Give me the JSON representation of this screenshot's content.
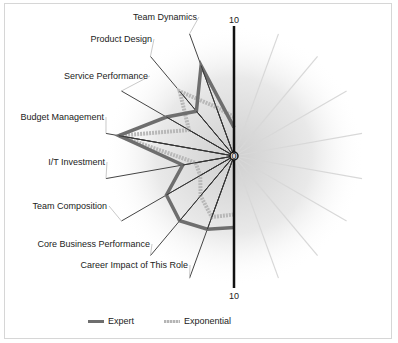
{
  "chart_data": {
    "type": "radar",
    "title": "",
    "scale": {
      "min": 0,
      "max": 10,
      "axis_labels": [
        "0",
        "10",
        "10"
      ]
    },
    "categories": [
      "Team Dynamics",
      "Product Design",
      "Service Performance",
      "Budget Management",
      "I/T Investment",
      "Team Composition",
      "Core Business Performance",
      "Career Impact of This Role"
    ],
    "category_angles_deg": [
      -20,
      -40,
      -60,
      -80,
      -100,
      -120,
      -140,
      -160
    ],
    "series": [
      {
        "name": "Expert",
        "color": "#6e6e6e",
        "top_value": 2.2,
        "values": [
          7.4,
          4.5,
          6.0,
          9.0,
          4.0,
          6.0,
          6.5,
          6.0
        ],
        "bottom_value": 5.5
      },
      {
        "name": "Exponential",
        "color": "#b8b8b8",
        "top_value": 3.0,
        "values": [
          4.0,
          6.5,
          4.0,
          9.0,
          3.0,
          3.0,
          4.0,
          5.0
        ],
        "bottom_value": 4.5
      }
    ],
    "right_spoke_angles_deg": [
      20,
      40,
      60,
      80,
      100,
      120,
      140,
      160
    ],
    "legend_position": "bottom"
  },
  "axis": {
    "zero": "0",
    "top_max": "10",
    "bottom_max": "10"
  },
  "legend": {
    "expert": "Expert",
    "exponential": "Exponential"
  }
}
